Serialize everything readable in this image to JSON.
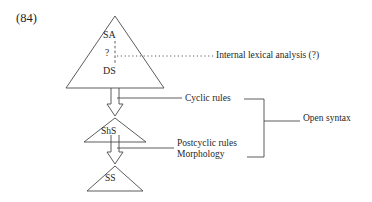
{
  "figure": {
    "example_number": "(84)",
    "type": "linguistic-derivation-diagram",
    "background_color": "#ffffff",
    "line_color": "#4a4a4a",
    "text_color": "#1f1f1f"
  },
  "nodes": [
    {
      "id": "sa",
      "label": "SA",
      "shape": "triangle-apex",
      "description": "Semantic Analysis at apex of large triangle"
    },
    {
      "id": "q",
      "label": "?",
      "shape": "text",
      "description": "Question mark on dashed internal line"
    },
    {
      "id": "ds",
      "label": "DS",
      "shape": "triangle-base",
      "description": "Deep Structure at base of large triangle"
    },
    {
      "id": "shs",
      "label": "ShS",
      "shape": "triangle",
      "description": "Shallow Structure triangle"
    },
    {
      "id": "ss",
      "label": "SS",
      "shape": "triangle",
      "description": "Surface Structure triangle"
    }
  ],
  "annotations": {
    "internal_lexical": "Internal lexical analysis (?)",
    "cyclic_rules": "Cyclic rules",
    "postcyclic_rules": "Postcyclic rules",
    "morphology": "Morphology",
    "open_syntax": "Open syntax"
  },
  "connectors": [
    {
      "id": "arrow-ds-to-shs",
      "from": "ds",
      "to": "shs",
      "style": "hollow-block-arrow",
      "direction": "down"
    },
    {
      "id": "arrow-shs-to-ss",
      "from": "shs",
      "to": "ss",
      "style": "hollow-block-arrow",
      "direction": "down"
    },
    {
      "id": "dashed-sa-to-ds",
      "from": "sa",
      "to": "ds",
      "style": "dashed-vertical"
    },
    {
      "id": "dotted-lexical-leader",
      "from": "q",
      "to": "internal_lexical",
      "style": "dotted-horizontal"
    },
    {
      "id": "leader-cyclic",
      "from": "arrow-ds-to-shs",
      "to": "cyclic_rules",
      "style": "solid-horizontal"
    },
    {
      "id": "leader-postcyclic",
      "from": "arrow-shs-to-ss",
      "to": "postcyclic_rules",
      "style": "solid-horizontal"
    },
    {
      "id": "bracket-open-syntax",
      "spans": [
        "cyclic_rules",
        "postcyclic_rules"
      ],
      "to": "open_syntax",
      "style": "right-brace-bracket"
    }
  ]
}
